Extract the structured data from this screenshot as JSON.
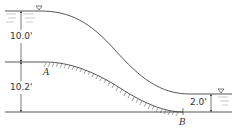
{
  "diagram": {
    "type": "open-channel transition / spillway profile",
    "colors": {
      "line": "#555555",
      "water_line": "#444444",
      "hatch": "#666666",
      "text": "#333333"
    },
    "dimensions": {
      "upstream_depth": "10.0'",
      "bed_drop": "10.2'",
      "downstream_depth": "2.0'"
    },
    "points": {
      "a": "A",
      "b": "B"
    },
    "symbols": {
      "upstream_surface": "water-surface-triangle",
      "downstream_surface": "water-surface-triangle"
    }
  }
}
